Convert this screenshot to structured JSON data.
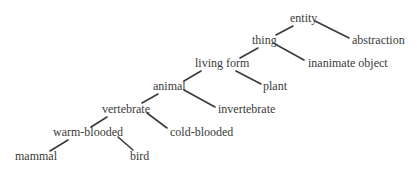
{
  "diagram": {
    "type": "taxonomy-tree",
    "text_color": "#3a3a3a",
    "line_color": "#3a3a3a",
    "background": "#ffffff",
    "nodes": [
      {
        "id": "entity",
        "label": "entity",
        "x": 290,
        "y": 22
      },
      {
        "id": "abstraction",
        "label": "abstraction",
        "x": 352,
        "y": 44
      },
      {
        "id": "thing",
        "label": "thing",
        "x": 252,
        "y": 44
      },
      {
        "id": "inanimate_object",
        "label": "inanimate object",
        "x": 308,
        "y": 67
      },
      {
        "id": "living_form",
        "label": "living form",
        "x": 195,
        "y": 67
      },
      {
        "id": "plant",
        "label": "plant",
        "x": 263,
        "y": 90
      },
      {
        "id": "animal",
        "label": "animal",
        "x": 153,
        "y": 90
      },
      {
        "id": "invertebrate",
        "label": "invertebrate",
        "x": 218,
        "y": 113
      },
      {
        "id": "vertebrate",
        "label": "vertebrate",
        "x": 102,
        "y": 113
      },
      {
        "id": "cold_blooded",
        "label": "cold-blooded",
        "x": 170,
        "y": 136
      },
      {
        "id": "warm_blooded",
        "label": "warm-blooded",
        "x": 53,
        "y": 136
      },
      {
        "id": "mammal",
        "label": "mammal",
        "x": 15,
        "y": 160
      },
      {
        "id": "bird",
        "label": "bird",
        "x": 130,
        "y": 160
      }
    ],
    "edges": [
      {
        "from": "entity",
        "to": "thing"
      },
      {
        "from": "entity",
        "to": "abstraction"
      },
      {
        "from": "thing",
        "to": "living_form"
      },
      {
        "from": "thing",
        "to": "inanimate_object"
      },
      {
        "from": "living_form",
        "to": "animal"
      },
      {
        "from": "living_form",
        "to": "plant"
      },
      {
        "from": "animal",
        "to": "vertebrate"
      },
      {
        "from": "animal",
        "to": "invertebrate"
      },
      {
        "from": "vertebrate",
        "to": "warm_blooded"
      },
      {
        "from": "vertebrate",
        "to": "cold_blooded"
      },
      {
        "from": "warm_blooded",
        "to": "mammal"
      },
      {
        "from": "warm_blooded",
        "to": "bird"
      }
    ]
  }
}
